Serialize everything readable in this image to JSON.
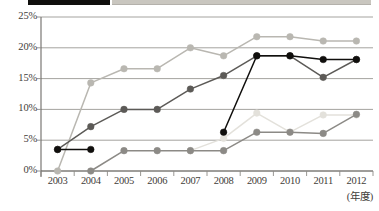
{
  "legend": {
    "items": [
      {
        "name": "legend-swatch-dark",
        "color": "#100f0d",
        "label": ""
      },
      {
        "name": "legend-swatch-light",
        "color": "#c9c6bf",
        "label": ""
      }
    ]
  },
  "axis": {
    "y_ticks": [
      "25%",
      "20%",
      "15%",
      "10%",
      "5%",
      "0%"
    ],
    "x_ticks": [
      "2003",
      "2004",
      "2005",
      "2006",
      "2007",
      "2008",
      "2009",
      "2010",
      "2011",
      "2012"
    ],
    "x_unit_label": "(年度)"
  },
  "chart_data": {
    "type": "line",
    "title": "",
    "subtitle": "",
    "xlabel": "(年度)",
    "ylabel": "",
    "categories": [
      "2003",
      "2004",
      "2005",
      "2006",
      "2007",
      "2008",
      "2009",
      "2010",
      "2011",
      "2012"
    ],
    "x": [
      2003,
      2004,
      2005,
      2006,
      2007,
      2008,
      2009,
      2010,
      2011,
      2012
    ],
    "ylim": [
      0,
      25
    ],
    "ytick_values": [
      0,
      5,
      10,
      15,
      20,
      25
    ],
    "ytick_labels": [
      "0%",
      "5%",
      "10%",
      "15%",
      "20%",
      "25%"
    ],
    "grid": true,
    "grid_axis": "y",
    "legend_position": "top-cropped",
    "value_unit": "%",
    "series": [
      {
        "name": "series-black",
        "color": "#100f0d",
        "marker": "circle",
        "values": [
          3.5,
          3.5,
          null,
          null,
          null,
          6.3,
          18.7,
          18.7,
          18.1,
          18.1
        ]
      },
      {
        "name": "series-dark-gray",
        "color": "#5c5a57",
        "marker": "circle",
        "values": [
          3.5,
          7.2,
          10.0,
          10.0,
          13.3,
          15.5,
          18.7,
          18.7,
          15.2,
          18.1
        ]
      },
      {
        "name": "series-light-gray",
        "color": "#b9b7b1",
        "marker": "circle",
        "values": [
          0.0,
          14.3,
          16.6,
          16.6,
          20.0,
          18.7,
          21.8,
          21.8,
          21.1,
          21.1
        ]
      },
      {
        "name": "series-medium-gray",
        "color": "#8c8a86",
        "marker": "circle",
        "values": [
          null,
          0.0,
          3.3,
          3.3,
          3.3,
          3.3,
          6.3,
          6.3,
          6.1,
          9.2
        ]
      },
      {
        "name": "series-palest",
        "color": "#e3e1db",
        "marker": "circle",
        "values": [
          null,
          null,
          null,
          null,
          3.3,
          5.3,
          9.4,
          6.3,
          9.1,
          9.1
        ]
      }
    ]
  }
}
